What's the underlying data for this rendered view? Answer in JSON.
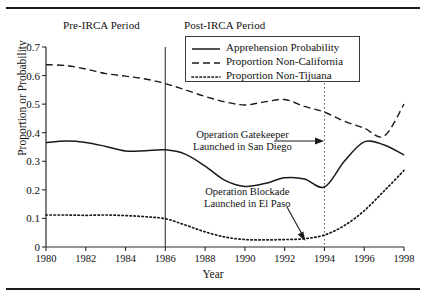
{
  "chart_data": {
    "type": "line",
    "title": "",
    "xlabel": "Year",
    "ylabel": "Proportion or Probability",
    "xlim": [
      1980,
      1998
    ],
    "ylim": [
      0,
      0.7
    ],
    "grid": false,
    "legend_position": "top-center",
    "xticks": [
      "1980",
      "1982",
      "1984",
      "1986",
      "1988",
      "1990",
      "1992",
      "1994",
      "1996",
      "1998"
    ],
    "xtick_values": [
      1980,
      1982,
      1984,
      1986,
      1988,
      1990,
      1992,
      1994,
      1996,
      1998
    ],
    "yticks": [
      "0",
      "0.1",
      "0.2",
      "0.3",
      "0.4",
      "0.5",
      "0.6",
      "0.7"
    ],
    "ytick_values": [
      0,
      0.1,
      0.2,
      0.3,
      0.4,
      0.5,
      0.6,
      0.7
    ],
    "x": [
      1980,
      1981,
      1982,
      1983,
      1984,
      1985,
      1986,
      1987,
      1988,
      1989,
      1990,
      1991,
      1992,
      1993,
      1994,
      1995,
      1996,
      1997,
      1998
    ],
    "series": [
      {
        "name": "Apprehension Probability",
        "style": "solid",
        "color": "#1a1a1a",
        "values": [
          0.365,
          0.371,
          0.366,
          0.352,
          0.336,
          0.337,
          0.34,
          0.325,
          0.283,
          0.233,
          0.212,
          0.222,
          0.242,
          0.238,
          0.21,
          0.3,
          0.368,
          0.357,
          0.322
        ]
      },
      {
        "name": "Proportion Non-California",
        "style": "dashed",
        "color": "#1a1a1a",
        "values": [
          0.638,
          0.635,
          0.623,
          0.607,
          0.598,
          0.588,
          0.572,
          0.55,
          0.527,
          0.508,
          0.497,
          0.508,
          0.516,
          0.492,
          0.472,
          0.44,
          0.416,
          0.388,
          0.5
        ]
      },
      {
        "name": "Proportion Non-Tijuana",
        "style": "dotted",
        "color": "#1a1a1a",
        "values": [
          0.112,
          0.112,
          0.111,
          0.112,
          0.11,
          0.106,
          0.099,
          0.077,
          0.053,
          0.035,
          0.026,
          0.025,
          0.026,
          0.029,
          0.042,
          0.075,
          0.127,
          0.196,
          0.268
        ]
      }
    ],
    "reference_lines": [
      {
        "name": "irca-divider",
        "x": 1986,
        "style": "solid"
      },
      {
        "name": "gatekeeper-divider",
        "x": 1994,
        "style": "dotted"
      }
    ],
    "annotations": [
      {
        "name": "operation-gatekeeper",
        "line1": "Operation Gatekeeper",
        "line2": "Launched in San Diego",
        "arrow": "horizontal-right",
        "target_x": 1994,
        "target_y": 0.33
      },
      {
        "name": "operation-blockade",
        "line1": "Operation Blockade",
        "line2": "Launched in El Paso",
        "arrow": "diagonal-down-right",
        "target_x": 1993,
        "target_y": 0.028
      }
    ],
    "period_labels": [
      {
        "name": "pre-irca",
        "text": "Pre-IRCA Period"
      },
      {
        "name": "post-irca",
        "text": "Post-IRCA Period"
      }
    ]
  }
}
